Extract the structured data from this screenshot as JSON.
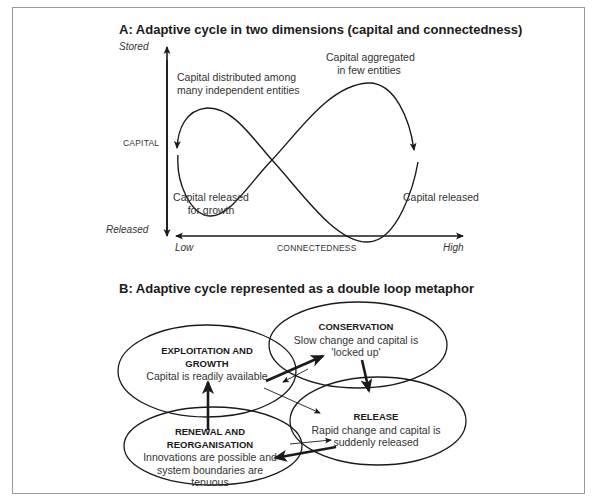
{
  "panel_a": {
    "title": "A: Adaptive cycle in two dimensions (capital and connectedness)",
    "y_axis": {
      "label": "CAPITAL",
      "top": "Stored",
      "bottom": "Released"
    },
    "x_axis": {
      "label": "CONNECTEDNESS",
      "left": "Low",
      "right": "High"
    },
    "annotations": {
      "distributed_1": "Capital distributed among",
      "distributed_2": "many independent entities",
      "aggregated_1": "Capital aggregated",
      "aggregated_2": "in few entities",
      "released_growth_1": "Capital released",
      "released_growth_2": "for growth",
      "released": "Capital released"
    }
  },
  "panel_b": {
    "title": "B: Adaptive cycle represented as a double loop metaphor",
    "phases": {
      "exploitation": {
        "name_1": "EXPLOITATION AND",
        "name_2": "GROWTH",
        "desc_1": "Capital is readily available"
      },
      "conservation": {
        "name_1": "CONSERVATION",
        "desc_1": "Slow change and capital is",
        "desc_2": "'locked up'"
      },
      "release": {
        "name_1": "RELEASE",
        "desc_1": "Rapid change and capital is",
        "desc_2": "suddenly released"
      },
      "renewal": {
        "name_1": "RENEWAL AND",
        "name_2": "REORGANISATION",
        "desc_1": "Innovations are possible and",
        "desc_2": "system boundaries are",
        "desc_3": "tenuous"
      }
    }
  },
  "colors": {
    "line": "#1a1a1a",
    "frame": "#9a9a9a",
    "text": "#333333"
  }
}
